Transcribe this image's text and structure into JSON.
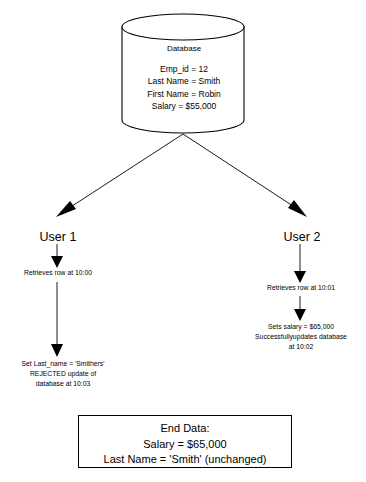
{
  "diagram": {
    "database": {
      "title": "Database",
      "fields": [
        "Emp_id = 12",
        "Last Name = Smith",
        "First Name = Robin",
        "Salary = $55,000"
      ],
      "fields_text": "Emp_id = 12\nLast Name = Smith\nFirst Name = Robin\nSalary = $55,000"
    },
    "user1": {
      "label": "User 1",
      "step1": "Retrieves row at 10:00",
      "step2_lines": [
        "Set Last_name = 'Smithers'",
        "REJECTED update of",
        "database at 10:03"
      ],
      "step2_text": "Set Last_name = 'Smithers'\nREJECTED update of\ndatabase at 10:03"
    },
    "user2": {
      "label": "User 2",
      "step1": "Retrieves row at 10:01",
      "step2_lines": [
        "Sets salary = $65,000",
        "Successfullyupdates database",
        "at 10:02"
      ],
      "step2_text": "Sets salary = $65,000\nSuccessfullyupdates database\nat 10:02"
    },
    "end_data": {
      "lines": [
        "End Data:",
        "Salary = $65,000",
        "Last Name = 'Smith' (unchanged)"
      ],
      "text": "End Data:\nSalary = $65,000\nLast Name = 'Smith' (unchanged)"
    },
    "colors": {
      "stroke": "#000000",
      "background": "#ffffff",
      "text": "#000000"
    }
  }
}
